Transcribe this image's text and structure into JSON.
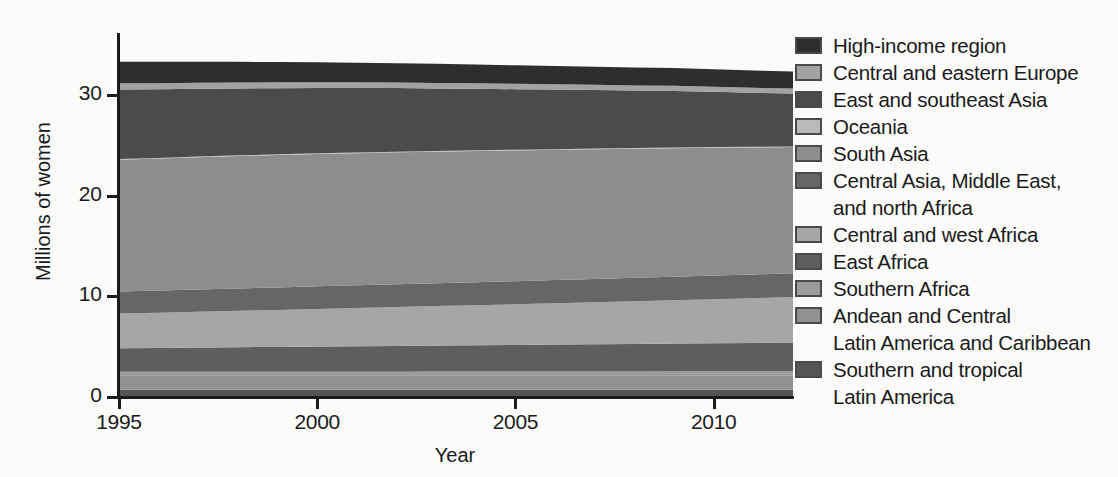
{
  "chart_data": {
    "type": "area",
    "title": "",
    "xlabel": "Year",
    "ylabel": "Millions of women",
    "xlim": [
      1995,
      2012
    ],
    "ylim": [
      0,
      36
    ],
    "xticks": [
      1995,
      2000,
      2005,
      2010
    ],
    "yticks": [
      0,
      10,
      20,
      30
    ],
    "grid": false,
    "legend_position": "right",
    "stacked": true,
    "stack_order_bottom_to_top": [
      "Southern and tropical Latin America",
      "Andean and Central Latin America and Caribbean",
      "Southern Africa",
      "East Africa",
      "Central and west Africa",
      "Central Asia, Middle East, and north Africa",
      "South Asia",
      "Oceania",
      "East and southeast Asia",
      "Central and eastern Europe",
      "High-income region"
    ],
    "x": [
      1995,
      1996,
      1997,
      1998,
      1999,
      2000,
      2001,
      2002,
      2003,
      2004,
      2005,
      2006,
      2007,
      2008,
      2009,
      2010,
      2011,
      2012
    ],
    "series": [
      {
        "name": "High-income region",
        "color": "#2e2e2e",
        "values": [
          2.15,
          2.12,
          2.08,
          2.05,
          2.02,
          1.99,
          1.96,
          1.93,
          1.9,
          1.87,
          1.84,
          1.82,
          1.8,
          1.78,
          1.76,
          1.74,
          1.72,
          1.7
        ]
      },
      {
        "name": "Central and eastern Europe",
        "color": "#a2a2a2",
        "values": [
          0.62,
          0.61,
          0.6,
          0.59,
          0.58,
          0.57,
          0.56,
          0.55,
          0.54,
          0.54,
          0.53,
          0.52,
          0.52,
          0.51,
          0.51,
          0.5,
          0.5,
          0.49
        ]
      },
      {
        "name": "East and southeast Asia",
        "color": "#4b4b4b",
        "values": [
          6.9,
          6.82,
          6.74,
          6.66,
          6.58,
          6.5,
          6.41,
          6.32,
          6.22,
          6.12,
          6.02,
          5.92,
          5.82,
          5.72,
          5.62,
          5.5,
          5.38,
          5.26
        ]
      },
      {
        "name": "Oceania",
        "color": "#b9b9b9",
        "values": [
          0.07,
          0.07,
          0.07,
          0.07,
          0.07,
          0.07,
          0.07,
          0.07,
          0.07,
          0.07,
          0.07,
          0.07,
          0.07,
          0.07,
          0.07,
          0.07,
          0.07,
          0.07
        ]
      },
      {
        "name": "South Asia",
        "color": "#8d8d8d",
        "values": [
          13.1,
          13.12,
          13.14,
          13.16,
          13.16,
          13.16,
          13.14,
          13.12,
          13.08,
          13.04,
          13.0,
          12.95,
          12.9,
          12.84,
          12.78,
          12.7,
          12.62,
          12.54
        ]
      },
      {
        "name": "Central Asia, Middle East, and north Africa",
        "color": "#666666",
        "values": [
          2.2,
          2.21,
          2.22,
          2.23,
          2.24,
          2.25,
          2.26,
          2.27,
          2.28,
          2.29,
          2.3,
          2.31,
          2.32,
          2.33,
          2.34,
          2.35,
          2.36,
          2.37
        ]
      },
      {
        "name": "Central and west Africa",
        "color": "#a6a6a6",
        "values": [
          3.45,
          3.5,
          3.56,
          3.62,
          3.68,
          3.74,
          3.8,
          3.86,
          3.92,
          3.98,
          4.04,
          4.1,
          4.17,
          4.24,
          4.31,
          4.38,
          4.45,
          4.52
        ]
      },
      {
        "name": "East Africa",
        "color": "#5e5e5e",
        "values": [
          2.35,
          2.38,
          2.41,
          2.44,
          2.47,
          2.5,
          2.53,
          2.56,
          2.59,
          2.62,
          2.65,
          2.68,
          2.71,
          2.74,
          2.77,
          2.8,
          2.83,
          2.86
        ]
      },
      {
        "name": "Southern Africa",
        "color": "#9c9c9c",
        "values": [
          0.33,
          0.33,
          0.34,
          0.34,
          0.34,
          0.35,
          0.35,
          0.35,
          0.36,
          0.36,
          0.36,
          0.37,
          0.37,
          0.37,
          0.38,
          0.38,
          0.38,
          0.39
        ]
      },
      {
        "name": "Andean and Central Latin America and Caribbean",
        "color": "#919191",
        "values": [
          1.45,
          1.45,
          1.45,
          1.45,
          1.45,
          1.45,
          1.45,
          1.45,
          1.45,
          1.45,
          1.45,
          1.45,
          1.45,
          1.45,
          1.45,
          1.45,
          1.45,
          1.45
        ]
      },
      {
        "name": "Southern and tropical Latin America",
        "color": "#555555",
        "values": [
          0.72,
          0.72,
          0.72,
          0.72,
          0.72,
          0.72,
          0.72,
          0.72,
          0.72,
          0.72,
          0.72,
          0.72,
          0.72,
          0.72,
          0.72,
          0.72,
          0.72,
          0.72
        ]
      }
    ]
  },
  "axes": {
    "y_title": "Millions of women",
    "x_title": "Year",
    "y_tick_labels": [
      "0",
      "10",
      "20",
      "30"
    ],
    "x_tick_labels": [
      "1995",
      "2000",
      "2005",
      "2010"
    ]
  },
  "legend": {
    "items": [
      {
        "label": "High-income region",
        "color": "#2e2e2e",
        "continuation": null
      },
      {
        "label": "Central and eastern Europe",
        "color": "#a2a2a2",
        "continuation": null
      },
      {
        "label": "East and southeast Asia",
        "color": "#4b4b4b",
        "continuation": null
      },
      {
        "label": "Oceania",
        "color": "#b9b9b9",
        "continuation": null
      },
      {
        "label": "South Asia",
        "color": "#8d8d8d",
        "continuation": null
      },
      {
        "label": "Central Asia, Middle East,",
        "color": "#666666",
        "continuation": "and north Africa"
      },
      {
        "label": "Central and west Africa",
        "color": "#a6a6a6",
        "continuation": null
      },
      {
        "label": "East Africa",
        "color": "#5e5e5e",
        "continuation": null
      },
      {
        "label": "Southern Africa",
        "color": "#9c9c9c",
        "continuation": null
      },
      {
        "label": "Andean and Central",
        "color": "#919191",
        "continuation": "Latin America and Caribbean"
      },
      {
        "label": "Southern and tropical",
        "color": "#555555",
        "continuation": "Latin America"
      }
    ]
  }
}
